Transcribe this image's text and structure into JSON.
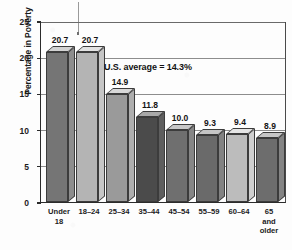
{
  "chart_data": {
    "type": "bar",
    "title": "",
    "subtitle": "",
    "xlabel": "",
    "ylabel": "Percentage in Poverty",
    "ylim": [
      0,
      25
    ],
    "ytick_values": [
      0,
      5,
      10,
      15,
      20,
      25
    ],
    "ytick_labels": [
      "0",
      "5",
      "10",
      "15",
      "20",
      "25"
    ],
    "grid": true,
    "grid_axis": "y",
    "legend": false,
    "legend_position": "none",
    "style": "3d-bar-grayscale",
    "categories": [
      "Under\n18",
      "18–24",
      "25–34",
      "35–44",
      "45–54",
      "55–59",
      "60–64",
      "65\nand\nolder"
    ],
    "values": [
      20.7,
      20.7,
      14.9,
      11.8,
      10.0,
      9.3,
      9.4,
      8.9
    ],
    "value_labels": [
      "20.7",
      "20.7",
      "14.9",
      "11.8",
      "10.0",
      "9.3",
      "9.4",
      "8.9"
    ],
    "bar_colors": [
      "#757575",
      "#b4b4b4",
      "#9a9a9a",
      "#4b4b4b",
      "#6f6f6f",
      "#6a6a6a",
      "#bcbcbc",
      "#6d6d6d"
    ],
    "bar_top_colors": [
      "#d2d2d2",
      "#e2e2e2",
      "#d8d8d8",
      "#a8a8a8",
      "#c8c8c8",
      "#c5c5c5",
      "#e5e5e5",
      "#c6c6c6"
    ],
    "bar_side_colors": [
      "#8d8d8d",
      "#c6c6c6",
      "#aeaeae",
      "#5e5e5e",
      "#868686",
      "#828282",
      "#cfcfcf",
      "#848484"
    ],
    "annotations": [
      {
        "text": "U.S. average = 14.3%",
        "value": 14.3,
        "x_fraction": 0.28,
        "y_value": 18.5
      }
    ]
  },
  "axis": {
    "y_title": "Percentage in Poverty"
  },
  "annotation": {
    "average_text": "U.S. average = 14.3%"
  },
  "colors": {
    "axis": "#2b2b2b",
    "gridline": "#8d8d8d",
    "text": "#141414",
    "background": "#fdfdfd"
  }
}
